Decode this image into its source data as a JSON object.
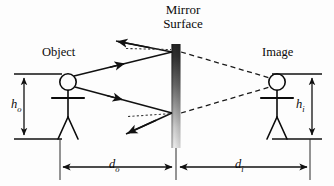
{
  "diagram": {
    "title_line1": "Mirror",
    "title_line2": "Surface",
    "object_label": "Object",
    "image_label": "Image",
    "object_height_symbol": "h",
    "object_height_subscript": "o",
    "image_height_symbol": "h",
    "image_height_subscript": "i",
    "object_distance_symbol": "d",
    "object_distance_subscript": "o",
    "image_distance_symbol": "d",
    "image_distance_subscript": "i",
    "colors": {
      "ink": "#0b0b0b",
      "ray": "#111111",
      "mirror_top": "#2b2b2b",
      "mirror_bottom": "#fbfbfb",
      "background": "#fdfdfd",
      "dimension_line": "#1a1a1a",
      "normal_dotted": "#3a3a3a"
    },
    "geometry": {
      "mirror_x": 176,
      "mirror_top_y": 44,
      "mirror_bottom_y": 148,
      "mirror_width": 9,
      "object_head_x": 68,
      "object_head_y": 82,
      "image_head_x": 277,
      "image_head_y": 82,
      "baseline_y": 140,
      "upper_hit_y": 52,
      "lower_hit_y": 113,
      "dimension_y": 167,
      "height_top_y": 74,
      "height_bottom_y": 139
    }
  }
}
